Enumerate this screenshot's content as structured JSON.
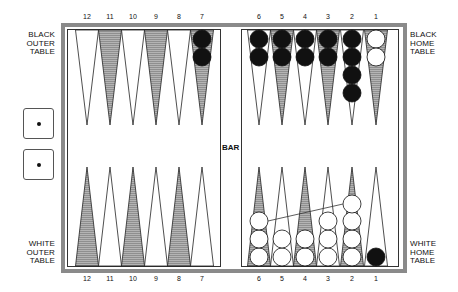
{
  "labels": {
    "black_outer": [
      "BLACK",
      "OUTER",
      "TABLE"
    ],
    "black_home": [
      "BLACK",
      "HOME",
      "TABLE"
    ],
    "white_outer": [
      "WHITE",
      "OUTER",
      "TABLE"
    ],
    "white_home": [
      "WHITE",
      "HOME",
      "TABLE"
    ],
    "bar": "BAR"
  },
  "top_numbers": [
    "12",
    "11",
    "10",
    "9",
    "8",
    "7",
    "6",
    "5",
    "4",
    "3",
    "2",
    "1"
  ],
  "bottom_numbers": [
    "12",
    "11",
    "10",
    "9",
    "8",
    "7",
    "6",
    "5",
    "4",
    "3",
    "2",
    "1"
  ],
  "dice": [
    {
      "value": 1
    },
    {
      "value": 1
    }
  ],
  "colors": {
    "frame": "#8a8a8a",
    "shaded_point": "#a8a8a8",
    "black_checker": "#111111",
    "white_checker": "#ffffff"
  },
  "top_points": [
    {
      "num": 12,
      "shaded": false,
      "checkers": []
    },
    {
      "num": 11,
      "shaded": true,
      "checkers": []
    },
    {
      "num": 10,
      "shaded": false,
      "checkers": []
    },
    {
      "num": 9,
      "shaded": true,
      "checkers": []
    },
    {
      "num": 8,
      "shaded": false,
      "checkers": []
    },
    {
      "num": 7,
      "shaded": true,
      "checkers": [
        "black",
        "black"
      ]
    },
    {
      "num": 6,
      "shaded": false,
      "checkers": [
        "black",
        "black"
      ]
    },
    {
      "num": 5,
      "shaded": true,
      "checkers": [
        "black",
        "black"
      ]
    },
    {
      "num": 4,
      "shaded": false,
      "checkers": [
        "black",
        "black"
      ]
    },
    {
      "num": 3,
      "shaded": true,
      "checkers": [
        "black",
        "black"
      ]
    },
    {
      "num": 2,
      "shaded": false,
      "checkers": [
        "black",
        "black",
        "black",
        "black"
      ]
    },
    {
      "num": 1,
      "shaded": true,
      "checkers": [
        "white",
        "white"
      ]
    }
  ],
  "bottom_points": [
    {
      "num": 12,
      "shaded": true,
      "checkers": []
    },
    {
      "num": 11,
      "shaded": false,
      "checkers": []
    },
    {
      "num": 10,
      "shaded": true,
      "checkers": []
    },
    {
      "num": 9,
      "shaded": false,
      "checkers": []
    },
    {
      "num": 8,
      "shaded": true,
      "checkers": []
    },
    {
      "num": 7,
      "shaded": false,
      "checkers": []
    },
    {
      "num": 6,
      "shaded": true,
      "checkers": [
        "white",
        "white",
        "white"
      ]
    },
    {
      "num": 5,
      "shaded": false,
      "checkers": [
        "white",
        "white"
      ]
    },
    {
      "num": 4,
      "shaded": true,
      "checkers": [
        "white",
        "white"
      ]
    },
    {
      "num": 3,
      "shaded": false,
      "checkers": [
        "white",
        "white",
        "white"
      ]
    },
    {
      "num": 2,
      "shaded": true,
      "checkers": [
        "white",
        "white",
        "white",
        "white"
      ]
    },
    {
      "num": 1,
      "shaded": false,
      "checkers": [
        "black"
      ]
    }
  ],
  "move_arrow": {
    "from_point": 6,
    "to_point": 2,
    "side": "white"
  }
}
